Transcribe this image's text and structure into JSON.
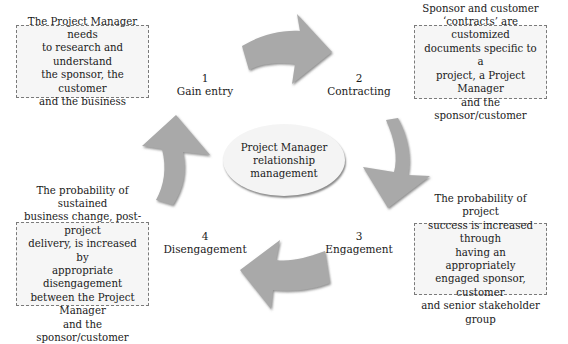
{
  "diagram": {
    "center": {
      "lines": [
        "Project Manager",
        "relationship",
        "management"
      ]
    },
    "stages": [
      {
        "number": "1",
        "label": "Gain entry"
      },
      {
        "number": "2",
        "label": "Contracting"
      },
      {
        "number": "3",
        "label": "Engagement"
      },
      {
        "number": "4",
        "label": "Disengagement"
      }
    ],
    "notes": {
      "top_left": [
        "The Project Manager needs",
        "to research and understand",
        "the sponsor, the customer",
        "and the business"
      ],
      "top_right": [
        "Sponsor and customer",
        "‘contracts’  are customized",
        "documents specific to a",
        "project, a Project Manager",
        "and the sponsor/customer"
      ],
      "bottom_right": [
        "The probability of project",
        "success is increased through",
        "having an appropriately",
        "engaged sponsor, customer",
        "and senior stakeholder group"
      ],
      "bottom_left": [
        "The probability of sustained",
        "business change, post-project",
        "delivery, is increased by",
        "appropriate disengagement",
        "between the Project Manager",
        "and the sponsor/customer"
      ]
    },
    "colors": {
      "arrow_fill": "#a8a8a8",
      "arrow_shadow": "#7c7c7c",
      "box_fill": "#f6f6f6",
      "box_border": "#7a7a7a"
    }
  }
}
